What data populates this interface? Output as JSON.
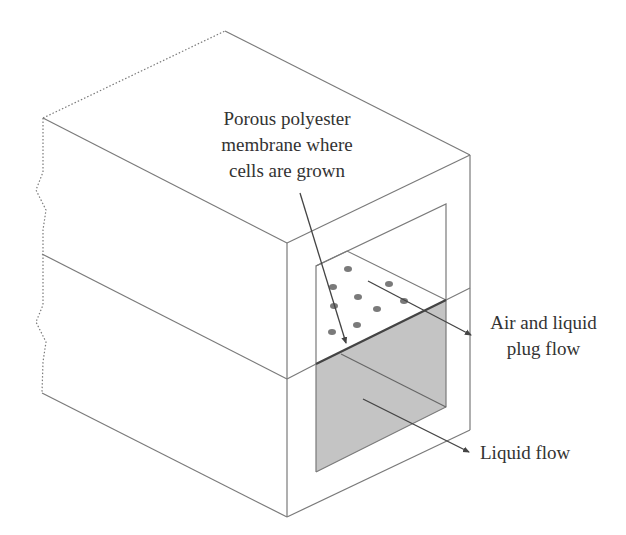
{
  "diagram": {
    "type": "isometric cross-section of a two-channel flow device",
    "colors": {
      "line": "#7a7a7a",
      "dark_line": "#444444",
      "fill_liquid": "#c4c4c4",
      "dot": "#7a7a7a",
      "text": "#333333",
      "background": "#ffffff"
    },
    "labels": {
      "membrane": {
        "lines": [
          "Porous polyester",
          "membrane where",
          "cells are grown"
        ]
      },
      "air_liquid": {
        "lines": [
          "Air and liquid",
          "plug flow"
        ]
      },
      "liquid": {
        "text": "Liquid flow"
      }
    },
    "components": [
      {
        "name": "upper-channel",
        "content": "Air and liquid plug flow"
      },
      {
        "name": "porous-membrane",
        "content": "Porous polyester membrane where cells are grown"
      },
      {
        "name": "lower-channel",
        "content": "Liquid flow"
      }
    ],
    "pore_dots_count": 9
  }
}
